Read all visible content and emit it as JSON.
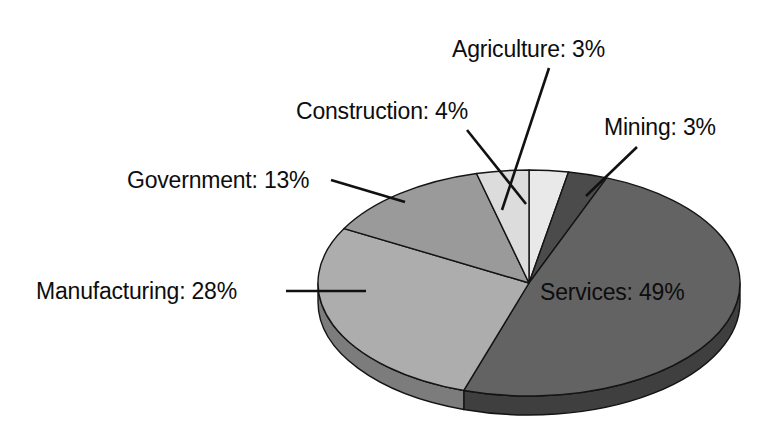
{
  "chart_data": {
    "type": "pie",
    "title": "",
    "subtitle": "",
    "xlabel": "",
    "ylabel": "",
    "legend_position": "none",
    "grid": false,
    "style": "3d-grayscale",
    "units": "percent",
    "categories": [
      "Agriculture",
      "Mining",
      "Services",
      "Manufacturing",
      "Government",
      "Construction"
    ],
    "values": [
      3,
      3,
      49,
      28,
      13,
      4
    ],
    "labels": [
      "Agriculture: 3%",
      "Mining: 3%",
      "Services: 49%",
      "Manufacturing: 28%",
      "Government: 13%",
      "Construction: 4%"
    ],
    "slices": [
      {
        "name": "Agriculture",
        "label": "Agriculture: 3%",
        "value": 3,
        "color": "#e9e9e9",
        "side_color": "#bdbdbd",
        "start_angle": 0,
        "end_angle": 10.8,
        "label_position": "top-center",
        "label_x": 452,
        "label_y": 57,
        "leader": [
          [
            549,
            68
          ],
          [
            502,
            210
          ]
        ]
      },
      {
        "name": "Mining",
        "label": "Mining: 3%",
        "value": 3,
        "color": "#4b4b4b",
        "side_color": "#2e2e2e",
        "start_angle": 10.8,
        "end_angle": 21.6,
        "label_position": "top-right",
        "label_x": 604,
        "label_y": 135,
        "leader": [
          [
            637,
            147
          ],
          [
            586,
            196
          ]
        ]
      },
      {
        "name": "Services",
        "label": "Services: 49%",
        "value": 49,
        "color": "#636363",
        "side_color": "#3f3f3f",
        "start_angle": 21.6,
        "end_angle": 198.0,
        "label_position": "inside",
        "label_x": 540,
        "label_y": 300,
        "leader": null
      },
      {
        "name": "Manufacturing",
        "label": "Manufacturing: 28%",
        "value": 28,
        "color": "#adadad",
        "side_color": "#7c7c7c",
        "start_angle": 198.0,
        "end_angle": 298.8,
        "label_position": "left",
        "label_x": 36,
        "label_y": 299,
        "leader": [
          [
            286,
            291
          ],
          [
            366,
            291
          ]
        ]
      },
      {
        "name": "Government",
        "label": "Government: 13%",
        "value": 13,
        "color": "#9a9a9a",
        "side_color": "#6e6e6e",
        "start_angle": 298.8,
        "end_angle": 345.6,
        "label_position": "upper-left",
        "label_x": 127,
        "label_y": 188,
        "leader": [
          [
            331,
            180
          ],
          [
            405,
            202
          ]
        ]
      },
      {
        "name": "Construction",
        "label": "Construction: 4%",
        "value": 4,
        "color": "#dcdcdc",
        "side_color": "#b0b0b0",
        "start_angle": 345.6,
        "end_angle": 360,
        "label_position": "upper-center-left",
        "label_x": 296,
        "label_y": 119,
        "leader": [
          [
            467,
            130
          ],
          [
            526,
            204
          ]
        ]
      }
    ],
    "total": 100,
    "geometry": {
      "center_x": 529,
      "center_y": 283,
      "radius_x": 211,
      "radius_y": 113,
      "depth": 19,
      "start_angle_deg": -90,
      "direction": "clockwise"
    },
    "colors": {
      "background": "#ffffff",
      "outline": "#141414",
      "text": "#0d0d0d",
      "leader": "#111111"
    }
  }
}
